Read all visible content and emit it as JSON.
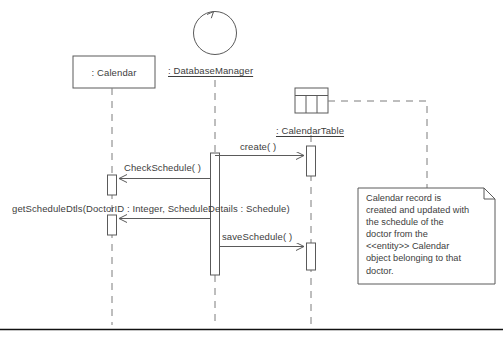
{
  "diagram": {
    "type": "uml-sequence-diagram"
  },
  "participants": [
    {
      "id": "calendar",
      "label": ": Calendar",
      "shape": "object-box",
      "lifeline_x": 112,
      "box": {
        "x": 73,
        "y": 56,
        "w": 82,
        "h": 32
      }
    },
    {
      "id": "databasemanager",
      "label": ": DatabaseManager",
      "shape": "control-circle",
      "lifeline_x": 215,
      "circle": {
        "cx": 215,
        "cy": 32,
        "r": 22
      },
      "label_pos": {
        "x": 168,
        "y": 66
      }
    },
    {
      "id": "calendartable",
      "label": ": CalendarTable",
      "shape": "table-icon",
      "lifeline_x": 311,
      "icon": {
        "x": 295,
        "y": 88,
        "w": 33,
        "h": 25
      },
      "label_pos": {
        "x": 276,
        "y": 126
      }
    }
  ],
  "messages": [
    {
      "id": "m1",
      "label": "create( )",
      "from": "databasemanager",
      "to": "calendartable",
      "y": 156,
      "label_x": 240,
      "label_y": 141,
      "direction": "right"
    },
    {
      "id": "m2",
      "label": "CheckSchedule( )",
      "from": "databasemanager",
      "to": "calendar",
      "y": 178,
      "label_x": 124,
      "label_y": 162,
      "direction": "left"
    },
    {
      "id": "m3",
      "label": "getScheduleDtls(DoctorID : Integer, ScheduleDetails : Schedule)",
      "from": "databasemanager",
      "to": "calendar",
      "y": 219,
      "label_x": 12,
      "label_y": 203,
      "direction": "left"
    },
    {
      "id": "m4",
      "label": "saveSchedule( )",
      "from": "databasemanager",
      "to": "calendartable",
      "y": 247,
      "label_x": 222,
      "label_y": 231,
      "direction": "right"
    }
  ],
  "activations": [
    {
      "id": "a1",
      "participant": "databasemanager",
      "x": 211,
      "y": 153,
      "w": 9,
      "h": 122
    },
    {
      "id": "a2",
      "participant": "calendartable",
      "x": 307,
      "y": 146,
      "w": 9,
      "h": 30
    },
    {
      "id": "a3",
      "participant": "calendar",
      "x": 108,
      "y": 175,
      "w": 9,
      "h": 20
    },
    {
      "id": "a4",
      "participant": "calendar",
      "x": 108,
      "y": 215,
      "w": 9,
      "h": 20
    },
    {
      "id": "a5",
      "participant": "calendartable",
      "x": 307,
      "y": 243,
      "w": 9,
      "h": 27
    }
  ],
  "note": {
    "id": "note1",
    "text": "Calendar record is\ncreated and updated with\nthe schedule of the\ndoctor from the\n<<entity>> Calendar\nobject belonging to that\ndoctor.",
    "box": {
      "x": 358,
      "y": 188,
      "w": 137,
      "h": 96
    },
    "fold": 11,
    "anchor_to": "calendartable"
  },
  "colors": {
    "stroke": "#5a5a5a",
    "text": "#3d3d3d",
    "background": "#ffffff",
    "baseline": "#111111"
  }
}
